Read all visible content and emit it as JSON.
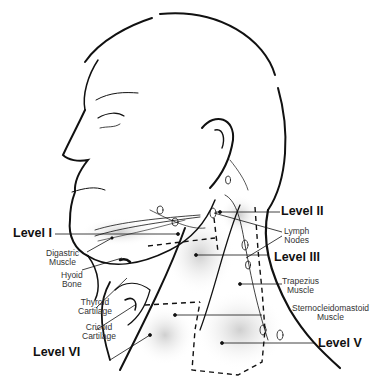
{
  "diagram": {
    "levels": [
      {
        "id": "I",
        "label": "Level I"
      },
      {
        "id": "II",
        "label": "Level II"
      },
      {
        "id": "III",
        "label": "Level III"
      },
      {
        "id": "V",
        "label": "Level V"
      },
      {
        "id": "VI",
        "label": "Level VI"
      }
    ],
    "structures": {
      "digastric": [
        "Digastric",
        "Muscle"
      ],
      "hyoid": [
        "Hyoid",
        "Bone"
      ],
      "thyroid": [
        "Thyroid",
        "Cartilage"
      ],
      "cricoid": [
        "Cricoid",
        "Cartilage"
      ],
      "lymph": [
        "Lymph",
        "Nodes"
      ],
      "trapezius": [
        "Trapezius",
        "Muscle"
      ],
      "scm": [
        "Sternocleidomastoid",
        "Muscle"
      ]
    },
    "colors": {
      "line": "#111111",
      "shade": "#d8d8d8",
      "text": "#333333"
    }
  }
}
